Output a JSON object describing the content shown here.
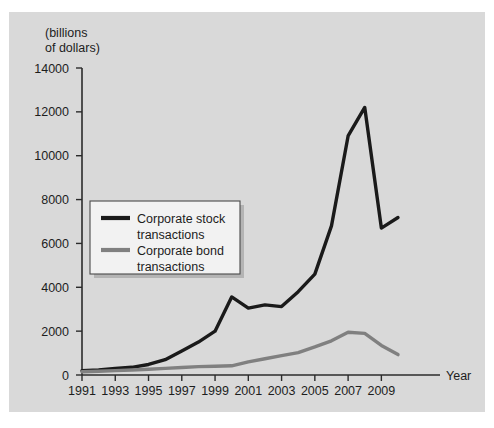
{
  "chart_data": {
    "type": "line",
    "title": "",
    "subtitle": "",
    "unit_caption_line1": "(billions",
    "unit_caption_line2": "of dollars)",
    "xlabel": "Year",
    "ylabel": "",
    "grid": false,
    "legend_position": "inside-left",
    "xlim": [
      1991,
      2010
    ],
    "ylim": [
      0,
      14000
    ],
    "ytick_step": 2000,
    "yticks": [
      "0",
      "2000",
      "4000",
      "6000",
      "8000",
      "10000",
      "12000",
      "14000"
    ],
    "ytick_values": [
      0,
      2000,
      4000,
      6000,
      8000,
      10000,
      12000,
      14000
    ],
    "xticks": [
      "1991",
      "1993",
      "1995",
      "1997",
      "1999",
      "2001",
      "2003",
      "2005",
      "2007",
      "2009"
    ],
    "xtick_values": [
      1991,
      1993,
      1995,
      1997,
      1999,
      2001,
      2003,
      2005,
      2007,
      2009
    ],
    "x": [
      1991,
      1992,
      1993,
      1994,
      1995,
      1996,
      1997,
      1998,
      1999,
      2000,
      2001,
      2002,
      2003,
      2004,
      2005,
      2006,
      2007,
      2008,
      2009,
      2010
    ],
    "series": [
      {
        "name": "Corporate stock transactions",
        "color": "#1a1a1a",
        "values": [
          200,
          230,
          300,
          350,
          480,
          700,
          1100,
          1500,
          2000,
          3560,
          3050,
          3200,
          3120,
          3800,
          4600,
          6800,
          10900,
          12200,
          6700,
          7180
        ]
      },
      {
        "name": "Corporate bond transactions",
        "color": "#808080",
        "values": [
          150,
          170,
          200,
          230,
          260,
          300,
          340,
          380,
          400,
          420,
          600,
          740,
          880,
          1020,
          1280,
          1560,
          1950,
          1900,
          1350,
          930
        ]
      }
    ],
    "annotations": []
  },
  "legend": {
    "entries": [
      {
        "label_line1": "Corporate stock",
        "label_line2": "transactions",
        "color": "#1a1a1a"
      },
      {
        "label_line1": "Corporate bond",
        "label_line2": "transactions",
        "color": "#808080"
      }
    ]
  },
  "colors": {
    "page_background": "#ffffff",
    "plate_background": "#d9d9d9",
    "axis": "#2b2b2b",
    "text": "#1d1d1d",
    "stock_series": "#1a1a1a",
    "bond_series": "#808080",
    "legend_fill": "#f2f2f2",
    "legend_border": "#4a4a4a",
    "legend_shadow": "#b4b4b4"
  }
}
